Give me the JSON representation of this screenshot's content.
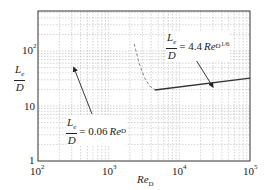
{
  "chart_data": {
    "type": "line",
    "xscale": "log",
    "yscale": "log",
    "xlim": [
      100,
      100000
    ],
    "ylim": [
      1,
      540
    ],
    "xlabel": "Re_D",
    "ylabel": "L_e/D",
    "grid": true,
    "x_ticks": [
      "10^2",
      "10^3",
      "10^4",
      "10^5"
    ],
    "y_ticks": [
      "1",
      "10",
      "10^2"
    ],
    "series": [
      {
        "name": "L_e/D = 4.4 Re_D^(1/6)",
        "style": "solid",
        "x": [
          4500,
          100000
        ],
        "y": [
          19.5,
          32
        ]
      },
      {
        "name": "L_e/D = 0.06 Re_D",
        "style": "dashed",
        "x": [
          2300,
          2700,
          3200,
          3800,
          4600
        ],
        "y": [
          135,
          60,
          33,
          23,
          19.5
        ]
      }
    ],
    "annotations": [
      {
        "text": "L_e/D = 4.4 Re_D^(1/6)",
        "arrow_to": [
          30000,
          25
        ]
      },
      {
        "text": "L_e/D = 0.06 Re_D",
        "arrow_to": [
          300,
          55
        ]
      }
    ]
  },
  "labels": {
    "x_ticks": [
      {
        "base": "10",
        "exp": "2"
      },
      {
        "base": "10",
        "exp": "3"
      },
      {
        "base": "10",
        "exp": "4"
      },
      {
        "base": "10",
        "exp": "5"
      }
    ],
    "y_ticks": [
      {
        "base": "10",
        "exp": "2"
      },
      {
        "base": "10",
        "exp": ""
      },
      {
        "base": "1",
        "exp": ""
      }
    ],
    "xlabel": {
      "main": "Re",
      "sub": "D"
    },
    "ylabel": {
      "num": "L",
      "num_sub": "e",
      "den": "D"
    },
    "eq_turbulent": {
      "num": "L",
      "num_sub": "e",
      "den": "D",
      "rhs": "= 4.4",
      "var": "Re",
      "var_sub": "D",
      "exp": "1/6"
    },
    "eq_laminar": {
      "num": "L",
      "num_sub": "e",
      "den": "D",
      "rhs": "= 0.06",
      "var": "Re",
      "var_sub": "D"
    }
  }
}
